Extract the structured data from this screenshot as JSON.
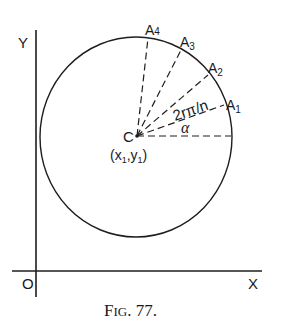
{
  "figure": {
    "caption": "Fig. 77.",
    "caption_prefix": "F",
    "caption_smallcaps": "IG",
    "caption_suffix": ". 77."
  },
  "axes": {
    "y_label": "Y",
    "x_label": "X",
    "origin_label": "O"
  },
  "circle": {
    "center_label": "C",
    "center_coords": "(x1,y1)",
    "center_coords_parts": {
      "open": "(",
      "x": "x",
      "x_sub": "1",
      "sep": ",",
      "y": "y",
      "y_sub": "1",
      "close": ")"
    }
  },
  "radii": [
    {
      "name": "A1",
      "letter": "A",
      "sub": "1"
    },
    {
      "name": "A2",
      "letter": "A",
      "sub": "2"
    },
    {
      "name": "A3",
      "letter": "A",
      "sub": "3"
    },
    {
      "name": "A4",
      "letter": "A",
      "sub": "4"
    }
  ],
  "angle_labels": {
    "alpha": "α",
    "step": "2rπ/n"
  }
}
